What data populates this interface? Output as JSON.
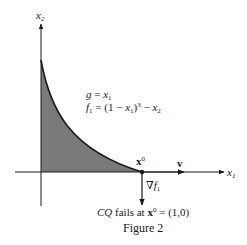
{
  "axes": {
    "x_label": "x",
    "x_label_sub": "1",
    "y_label": "x",
    "y_label_sub": "2"
  },
  "equations": {
    "g_lhs": "g",
    "g_rhs_var": "x",
    "g_rhs_sub": "1",
    "f_lhs": "f",
    "f_lhs_sub": "1",
    "f_rhs_a": " = (1 − ",
    "f_rhs_var": "x",
    "f_rhs_var_sub": "1",
    "f_rhs_b": ")",
    "f_rhs_exp": "3",
    "f_rhs_c": " − ",
    "f_rhs_var2": "x",
    "f_rhs_var2_sub": "2",
    "eq_sign": " = "
  },
  "point": {
    "label": "x",
    "label_sup": "0"
  },
  "vectors": {
    "v_label": "v",
    "grad_label": "∇f",
    "grad_sub": "1"
  },
  "caption": {
    "cq": "CQ",
    "text": " fails at ",
    "point": "x",
    "point_sup": "0",
    "value": " = (1,0)",
    "figure": "Figure 2"
  },
  "colors": {
    "ink": "#1a1a1a",
    "shade": "#7a7a7a"
  }
}
